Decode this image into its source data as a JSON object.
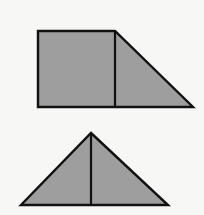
{
  "canvas": {
    "width": 204,
    "height": 215,
    "background_color": "#f7f7f6",
    "title": "Geometric Figures"
  },
  "style": {
    "fill_color": "#9e9e9e",
    "stroke_color": "#111111",
    "stroke_width": 2.4,
    "divider_stroke_width": 2.2
  },
  "figures": [
    {
      "id": "upper-figure",
      "name": "square-with-right-triangle",
      "description": "A square joined on its right side by a right triangle, forming a right trapezoid",
      "outline_points": "38,31 115,31 193,107 38,107",
      "divider_points": "115,31 115,107",
      "parts": [
        {
          "name": "square",
          "points": "38,31 115,31 115,107 38,107",
          "vertices": [
            [
              38,
              31
            ],
            [
              115,
              31
            ],
            [
              115,
              107
            ],
            [
              38,
              107
            ]
          ]
        },
        {
          "name": "right-triangle",
          "points": "115,31 193,107 115,107",
          "vertices": [
            [
              115,
              31
            ],
            [
              193,
              107
            ],
            [
              115,
              107
            ]
          ]
        }
      ]
    },
    {
      "id": "lower-figure",
      "name": "isosceles-triangle-with-median",
      "description": "An isosceles triangle divided by a vertical median from apex to base midpoint",
      "outline_points": "91,133 168,205 21,205",
      "divider_points": "91,133 91,205",
      "parts": [
        {
          "name": "left-half-triangle",
          "points": "91,133 91,205 21,205",
          "vertices": [
            [
              91,
              133
            ],
            [
              91,
              205
            ],
            [
              21,
              205
            ]
          ]
        },
        {
          "name": "right-half-triangle",
          "points": "91,133 168,205 91,205",
          "vertices": [
            [
              91,
              133
            ],
            [
              168,
              205
            ],
            [
              91,
              205
            ]
          ]
        }
      ]
    }
  ]
}
